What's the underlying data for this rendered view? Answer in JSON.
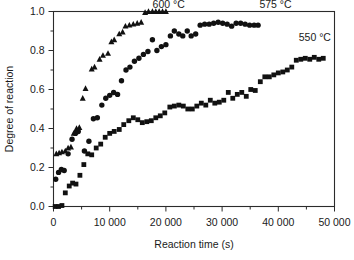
{
  "chart_data": {
    "type": "scatter",
    "title": "",
    "xlabel": "Reaction time (s)",
    "ylabel": "Degree of reaction",
    "xlim": [
      0,
      50000
    ],
    "ylim": [
      0.0,
      1.0
    ],
    "xticks": [
      0,
      10000,
      20000,
      30000,
      40000,
      50000
    ],
    "xticklabels": [
      "0",
      "10 000",
      "20 000",
      "30 000",
      "40 000",
      "50 000"
    ],
    "yticks": [
      0.0,
      0.2,
      0.4,
      0.6,
      0.8,
      1.0
    ],
    "yticklabels": [
      "0.0",
      "0.2",
      "0.4",
      "0.6",
      "0.8",
      "1.0"
    ],
    "minor_xticks": [
      5000,
      15000,
      25000,
      35000,
      45000
    ],
    "minor_yticks": [
      0.1,
      0.3,
      0.5,
      0.7,
      0.9
    ],
    "grid": false,
    "legend": "inline-annotations",
    "marker_color": "#111111",
    "series": [
      {
        "name": "600 °C",
        "label": "600 °C",
        "marker": "triangle",
        "annotation": {
          "text": "600 °C",
          "x": 20500,
          "y": 1.0
        },
        "points": [
          [
            500,
            0.27
          ],
          [
            1000,
            0.275
          ],
          [
            1500,
            0.28
          ],
          [
            2100,
            0.285
          ],
          [
            2600,
            0.3
          ],
          [
            3100,
            0.305
          ],
          [
            3600,
            0.375
          ],
          [
            4100,
            0.4
          ],
          [
            4600,
            0.405
          ],
          [
            5200,
            0.555
          ],
          [
            5700,
            0.605
          ],
          [
            6800,
            0.705
          ],
          [
            7300,
            0.715
          ],
          [
            8200,
            0.755
          ],
          [
            8800,
            0.775
          ],
          [
            9700,
            0.785
          ],
          [
            10300,
            0.845
          ],
          [
            10800,
            0.855
          ],
          [
            11700,
            0.885
          ],
          [
            12300,
            0.895
          ],
          [
            12800,
            0.925
          ],
          [
            13500,
            0.93
          ],
          [
            14200,
            0.935
          ],
          [
            14900,
            0.94
          ],
          [
            15600,
            0.945
          ],
          [
            16300,
            0.995
          ],
          [
            16900,
            1.0
          ],
          [
            17600,
            1.0
          ],
          [
            18200,
            1.0
          ],
          [
            18800,
            1.0
          ],
          [
            19400,
            1.0
          ],
          [
            20000,
            1.0
          ]
        ]
      },
      {
        "name": "575 °C",
        "label": "575 °C",
        "marker": "circle",
        "annotation": {
          "text": "575 °C",
          "x": 39500,
          "y": 1.0
        },
        "points": [
          [
            400,
            0.14
          ],
          [
            900,
            0.175
          ],
          [
            1400,
            0.19
          ],
          [
            1900,
            0.185
          ],
          [
            2600,
            0.27
          ],
          [
            3300,
            0.345
          ],
          [
            3900,
            0.375
          ],
          [
            4400,
            0.385
          ],
          [
            5500,
            0.285
          ],
          [
            6300,
            0.335
          ],
          [
            7100,
            0.45
          ],
          [
            7800,
            0.455
          ],
          [
            8600,
            0.52
          ],
          [
            9300,
            0.555
          ],
          [
            10000,
            0.57
          ],
          [
            10700,
            0.585
          ],
          [
            11400,
            0.575
          ],
          [
            12100,
            0.645
          ],
          [
            12900,
            0.7
          ],
          [
            13600,
            0.715
          ],
          [
            14400,
            0.745
          ],
          [
            15200,
            0.76
          ],
          [
            16000,
            0.78
          ],
          [
            16800,
            0.795
          ],
          [
            17600,
            0.855
          ],
          [
            18400,
            0.8
          ],
          [
            19200,
            0.82
          ],
          [
            20000,
            0.83
          ],
          [
            20800,
            0.875
          ],
          [
            21500,
            0.9
          ],
          [
            22300,
            0.885
          ],
          [
            23000,
            0.875
          ],
          [
            23800,
            0.9
          ],
          [
            24500,
            0.875
          ],
          [
            25300,
            0.885
          ],
          [
            26100,
            0.93
          ],
          [
            26900,
            0.935
          ],
          [
            27700,
            0.935
          ],
          [
            28500,
            0.94
          ],
          [
            29300,
            0.945
          ],
          [
            30100,
            0.94
          ],
          [
            30900,
            0.935
          ],
          [
            31700,
            0.925
          ],
          [
            32500,
            0.94
          ],
          [
            33300,
            0.94
          ],
          [
            34100,
            0.935
          ],
          [
            34900,
            0.93
          ],
          [
            35700,
            0.93
          ],
          [
            36400,
            0.93
          ]
        ]
      },
      {
        "name": "550 °C",
        "label": "550 °C",
        "marker": "square",
        "annotation": {
          "text": "550 °C",
          "x": 46500,
          "y": 0.83
        },
        "points": [
          [
            300,
            0.0
          ],
          [
            900,
            0.0
          ],
          [
            1500,
            0.005
          ],
          [
            2100,
            0.07
          ],
          [
            2800,
            0.105
          ],
          [
            3400,
            0.12
          ],
          [
            4000,
            0.115
          ],
          [
            4700,
            0.16
          ],
          [
            5400,
            0.215
          ],
          [
            6100,
            0.27
          ],
          [
            6800,
            0.265
          ],
          [
            7600,
            0.3
          ],
          [
            8400,
            0.32
          ],
          [
            9200,
            0.355
          ],
          [
            10000,
            0.375
          ],
          [
            10800,
            0.385
          ],
          [
            11700,
            0.395
          ],
          [
            12500,
            0.42
          ],
          [
            13400,
            0.44
          ],
          [
            14200,
            0.455
          ],
          [
            15000,
            0.445
          ],
          [
            15800,
            0.43
          ],
          [
            16600,
            0.435
          ],
          [
            17400,
            0.44
          ],
          [
            18200,
            0.455
          ],
          [
            19000,
            0.465
          ],
          [
            19800,
            0.48
          ],
          [
            20700,
            0.51
          ],
          [
            21500,
            0.515
          ],
          [
            22300,
            0.52
          ],
          [
            23100,
            0.515
          ],
          [
            23900,
            0.5
          ],
          [
            24700,
            0.5
          ],
          [
            25500,
            0.515
          ],
          [
            26300,
            0.53
          ],
          [
            27100,
            0.52
          ],
          [
            27900,
            0.545
          ],
          [
            28700,
            0.53
          ],
          [
            29500,
            0.535
          ],
          [
            30300,
            0.545
          ],
          [
            31100,
            0.585
          ],
          [
            31900,
            0.555
          ],
          [
            32700,
            0.575
          ],
          [
            33500,
            0.585
          ],
          [
            34300,
            0.565
          ],
          [
            35100,
            0.6
          ],
          [
            35900,
            0.595
          ],
          [
            36800,
            0.64
          ],
          [
            37600,
            0.665
          ],
          [
            38400,
            0.665
          ],
          [
            39200,
            0.675
          ],
          [
            40000,
            0.685
          ],
          [
            40800,
            0.69
          ],
          [
            41600,
            0.7
          ],
          [
            42400,
            0.715
          ],
          [
            43200,
            0.75
          ],
          [
            44000,
            0.755
          ],
          [
            44800,
            0.76
          ],
          [
            45600,
            0.755
          ],
          [
            46400,
            0.765
          ],
          [
            47200,
            0.755
          ],
          [
            48000,
            0.76
          ]
        ]
      }
    ]
  }
}
